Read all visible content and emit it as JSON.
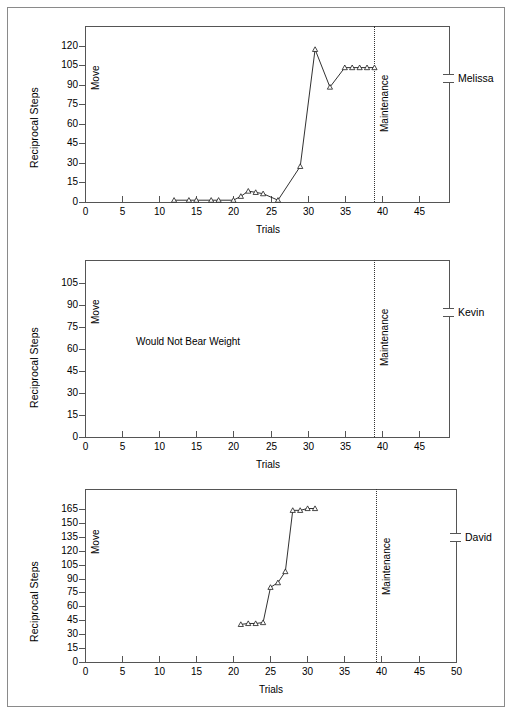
{
  "figure": {
    "panel_count": 3,
    "outer_border": true
  },
  "chart_data": [
    {
      "type": "line",
      "title": "",
      "subject": "Melissa",
      "xlabel": "Trials",
      "ylabel": "Reciprocal Steps",
      "xlim": [
        0,
        48
      ],
      "ylim": [
        0,
        127
      ],
      "xticks": [
        0,
        5,
        10,
        15,
        20,
        25,
        30,
        35,
        40,
        45
      ],
      "yticks": [
        0,
        15,
        30,
        45,
        60,
        75,
        90,
        105,
        120
      ],
      "grid": false,
      "legend": "none",
      "phase_labels": [
        "Move",
        "Maintenance"
      ],
      "phase_change_x": 39,
      "x": [
        12,
        14,
        15,
        17,
        18,
        20,
        21,
        22,
        23,
        24,
        26,
        29,
        31,
        33,
        35,
        36,
        37,
        38,
        39
      ],
      "values": [
        1,
        1,
        1,
        1,
        1,
        1,
        4,
        8,
        7,
        6,
        1,
        27,
        117,
        88,
        103,
        103,
        103,
        103,
        103
      ]
    },
    {
      "type": "line",
      "title": "",
      "subject": "Kevin",
      "xlabel": "Trials",
      "ylabel": "Reciprocal Steps",
      "xlim": [
        0,
        48
      ],
      "ylim": [
        0,
        113
      ],
      "xticks": [
        0,
        5,
        10,
        15,
        20,
        25,
        30,
        35,
        40,
        45
      ],
      "yticks": [
        0,
        15,
        30,
        45,
        60,
        75,
        90,
        105
      ],
      "grid": false,
      "legend": "none",
      "phase_labels": [
        "Move",
        "Maintenance"
      ],
      "phase_change_x": 39,
      "annotation": "Would Not Bear Weight",
      "x": [],
      "values": []
    },
    {
      "type": "line",
      "title": "",
      "subject": "David",
      "xlabel": "Trials",
      "ylabel": "Reciprocal Steps",
      "xlim": [
        0,
        50
      ],
      "ylim": [
        0,
        175
      ],
      "xticks": [
        0,
        5,
        10,
        15,
        20,
        25,
        30,
        35,
        40,
        45,
        50
      ],
      "yticks": [
        0,
        15,
        30,
        45,
        60,
        75,
        90,
        105,
        120,
        135,
        150,
        165
      ],
      "grid": false,
      "legend": "none",
      "phase_labels": [
        "Move",
        "Maintenance"
      ],
      "phase_change_x": 40,
      "x": [
        21,
        22,
        23,
        24,
        25,
        26,
        27,
        28,
        29,
        30,
        31
      ],
      "values": [
        40,
        41,
        41,
        42,
        80,
        85,
        97,
        163,
        163,
        165,
        165
      ]
    }
  ],
  "panels": [
    {
      "ylabel": "Reciprocal Steps",
      "xlabel": "Trials",
      "subject": "Melissa",
      "phase_move": "Move",
      "phase_maintenance": "Maintenance",
      "yticks": [
        "120",
        "105",
        "90",
        "75",
        "60",
        "45",
        "30",
        "15",
        "0"
      ],
      "xticks": [
        "0",
        "5",
        "10",
        "15",
        "20",
        "25",
        "30",
        "35",
        "40",
        "45"
      ],
      "annotation": ""
    },
    {
      "ylabel": "Reciprocal Steps",
      "xlabel": "Trials",
      "subject": "Kevin",
      "phase_move": "Move",
      "phase_maintenance": "Maintenance",
      "yticks": [
        "105",
        "90",
        "75",
        "60",
        "45",
        "30",
        "15",
        "0"
      ],
      "xticks": [
        "0",
        "5",
        "10",
        "15",
        "20",
        "25",
        "30",
        "35",
        "40",
        "45"
      ],
      "annotation": "Would Not Bear Weight"
    },
    {
      "ylabel": "Reciprocal Steps",
      "xlabel": "Trials",
      "subject": "David",
      "phase_move": "Move",
      "phase_maintenance": "Maintenance",
      "yticks": [
        "165",
        "150",
        "135",
        "120",
        "105",
        "90",
        "75",
        "60",
        "45",
        "30",
        "15",
        "0"
      ],
      "xticks": [
        "0",
        "5",
        "10",
        "15",
        "20",
        "25",
        "30",
        "35",
        "40",
        "45",
        "50"
      ],
      "annotation": ""
    }
  ],
  "colors": {
    "axis": "#555555",
    "line": "#1a1a1a",
    "marker_fill": "#ffffff",
    "border": "#8a8a8a",
    "background": "#ffffff"
  }
}
